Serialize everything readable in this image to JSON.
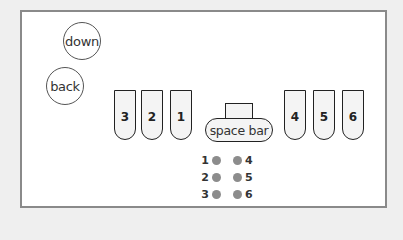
{
  "buttons": {
    "down": "down",
    "back": "back"
  },
  "keys_left": [
    {
      "label": "3",
      "x": 114
    },
    {
      "label": "2",
      "x": 141
    },
    {
      "label": "1",
      "x": 170
    }
  ],
  "space_bar": "space bar",
  "keys_right": [
    {
      "label": "4",
      "x": 284
    },
    {
      "label": "5",
      "x": 313
    },
    {
      "label": "6",
      "x": 342
    }
  ],
  "braille_cell": {
    "rows": [
      {
        "left": "1",
        "right": "4"
      },
      {
        "left": "2",
        "right": "5"
      },
      {
        "left": "3",
        "right": "6"
      }
    ],
    "dot_color": "#8c8c8c"
  }
}
